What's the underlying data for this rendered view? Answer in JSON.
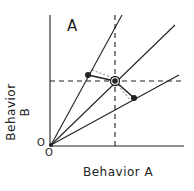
{
  "panel_label": "A",
  "x_axis_label": "Behavior  A",
  "y_axis_label": "Behavior  B",
  "origin_labels": [
    "O",
    "O"
  ],
  "diagram": {
    "type": "ray diagram",
    "rays": 3,
    "points": [
      "left point on steep ray",
      "central intersection point (circled)",
      "right point on shallow ray"
    ],
    "reference_lines": [
      "dashed vertical through center point",
      "dashed horizontal through center point"
    ]
  }
}
